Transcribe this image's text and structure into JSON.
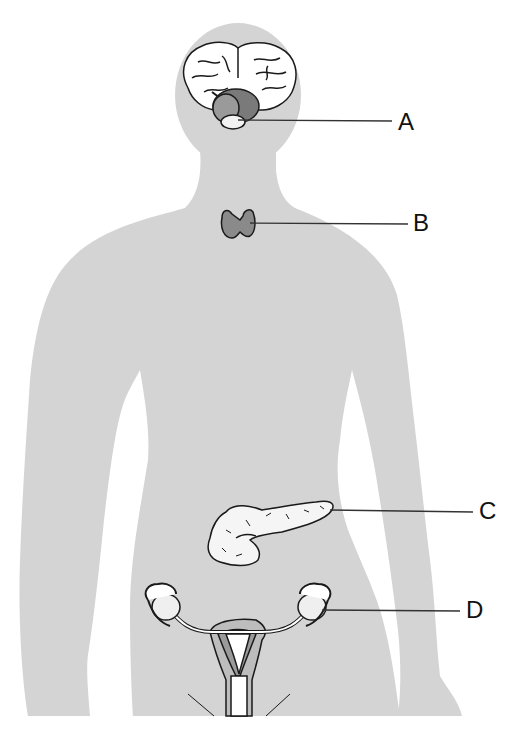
{
  "diagram": {
    "colors": {
      "body": "#d4d4d4",
      "outline": "#1a1a1a",
      "gland_dark": "#8a8a8a",
      "gland_light": "#f2f2f2",
      "background": "#ffffff",
      "uterus_mid": "#9a9a9a",
      "uterus_light": "#bdbdbd"
    },
    "labels": [
      {
        "id": "A",
        "text": "A",
        "structure": "pituitary-gland",
        "x": 398,
        "y": 110
      },
      {
        "id": "B",
        "text": "B",
        "structure": "thyroid-gland",
        "x": 412,
        "y": 211
      },
      {
        "id": "C",
        "text": "C",
        "structure": "pancreas",
        "x": 479,
        "y": 499
      },
      {
        "id": "D",
        "text": "D",
        "structure": "ovary",
        "x": 466,
        "y": 598
      }
    ]
  }
}
